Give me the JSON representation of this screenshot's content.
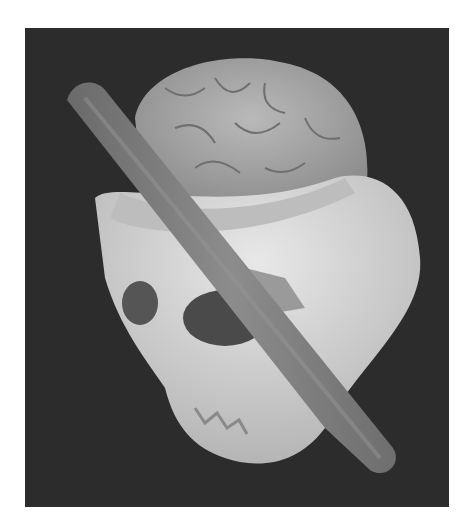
{
  "image": {
    "subject": "3D rendering of a human skull with exposed brain pierced by a tamping iron rod",
    "colors": {
      "background": "#ffffff",
      "panel": "#2c2c2c",
      "bone": "#d9d9d9",
      "bone_shadow": "#9a9a9a",
      "brain": "#a8a8a8",
      "rod": "#7d7d7d"
    }
  }
}
